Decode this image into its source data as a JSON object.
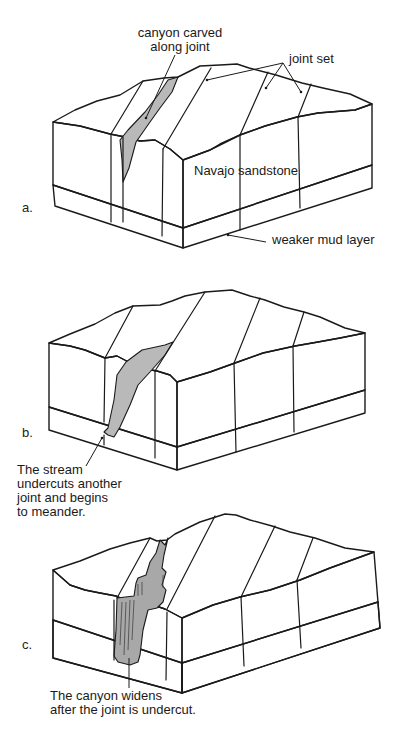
{
  "figure": {
    "panels": [
      {
        "id": "a",
        "letter": "a.",
        "labels": {
          "canyon": [
            "canyon carved",
            "along joint"
          ],
          "joint_set": "joint set",
          "sandstone": "Navajo sandstone",
          "mud": "weaker mud layer"
        }
      },
      {
        "id": "b",
        "letter": "b.",
        "labels": {
          "caption": [
            "The stream",
            "undercuts another",
            "joint and begins",
            "to meander."
          ]
        }
      },
      {
        "id": "c",
        "letter": "c.",
        "labels": {
          "caption": [
            "The canyon widens",
            "after the joint is undercut."
          ]
        }
      }
    ],
    "colors": {
      "line": "#1a1a1a",
      "canyon_fill": "#b9b9b9",
      "stipple": "#9a9a9a",
      "mud_dash": "#888888",
      "background": "#ffffff"
    }
  }
}
